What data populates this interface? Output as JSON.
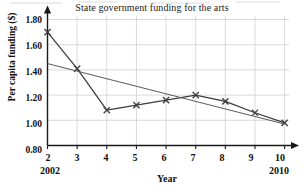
{
  "chart_data": {
    "type": "line",
    "title": "State government funding for the arts",
    "xlabel": "Year",
    "ylabel": "Per capita funding ($)",
    "x": [
      2,
      3,
      4,
      5,
      6,
      7,
      8,
      9,
      10
    ],
    "xticklabels": [
      "2",
      "3",
      "4",
      "5",
      "6",
      "7",
      "8",
      "9",
      "10"
    ],
    "xlim": [
      2,
      10.35
    ],
    "ylim": [
      0.8,
      1.8
    ],
    "yticks": [
      0.8,
      1.0,
      1.2,
      1.4,
      1.6,
      1.8
    ],
    "yticklabels": [
      "0.80",
      "1.00",
      "1.20",
      "1.40",
      "1.60",
      "1.80"
    ],
    "grid": true,
    "legend": "none",
    "x_start_annotation": "2002",
    "x_end_annotation": "2010",
    "series": [
      {
        "name": "Per capita funding",
        "marker": "x",
        "color": "#3c3c3c",
        "values": [
          1.7,
          1.41,
          1.08,
          1.12,
          1.16,
          1.2,
          1.15,
          1.06,
          0.98
        ]
      },
      {
        "name": "Trend line",
        "marker": "none",
        "color": "#5a5a5a",
        "x": [
          2,
          10
        ],
        "values": [
          1.45,
          0.97
        ]
      }
    ]
  }
}
